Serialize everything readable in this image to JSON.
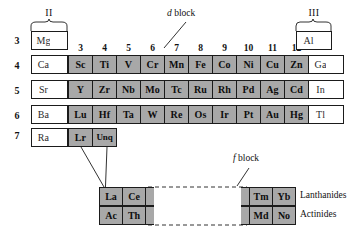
{
  "group_headers": {
    "left": "II",
    "right": "III"
  },
  "column_numbers": [
    "3",
    "4",
    "5",
    "6",
    "7",
    "8",
    "9",
    "10",
    "11",
    "12"
  ],
  "row_numbers": [
    "3",
    "4",
    "5",
    "6",
    "7"
  ],
  "annotations": {
    "d_block": "d block",
    "d_block_italic": "d",
    "d_block_rest": " block",
    "f_block_italic": "f",
    "f_block_rest": " block",
    "lanthanides": "Lanthanides",
    "actinides": "Actinides"
  },
  "main_table": {
    "rows": [
      {
        "period": "3",
        "cells": [
          {
            "symbol": "Mg",
            "type": "plain"
          },
          {
            "symbol": "",
            "type": "empty-d"
          },
          {
            "symbol": "",
            "type": "empty-d"
          },
          {
            "symbol": "",
            "type": "empty-d"
          },
          {
            "symbol": "",
            "type": "empty-d"
          },
          {
            "symbol": "",
            "type": "empty-d"
          },
          {
            "symbol": "",
            "type": "empty-d"
          },
          {
            "symbol": "",
            "type": "empty-d"
          },
          {
            "symbol": "",
            "type": "empty-d"
          },
          {
            "symbol": "",
            "type": "empty-d"
          },
          {
            "symbol": "",
            "type": "empty-d"
          },
          {
            "symbol": "Al",
            "type": "plain"
          }
        ]
      },
      {
        "period": "4",
        "cells": [
          {
            "symbol": "Ca",
            "type": "plain"
          },
          {
            "symbol": "Sc",
            "type": "d"
          },
          {
            "symbol": "Ti",
            "type": "d"
          },
          {
            "symbol": "V",
            "type": "d"
          },
          {
            "symbol": "Cr",
            "type": "d"
          },
          {
            "symbol": "Mn",
            "type": "d"
          },
          {
            "symbol": "Fe",
            "type": "d"
          },
          {
            "symbol": "Co",
            "type": "d"
          },
          {
            "symbol": "Ni",
            "type": "d"
          },
          {
            "symbol": "Cu",
            "type": "d"
          },
          {
            "symbol": "Zn",
            "type": "d"
          },
          {
            "symbol": "Ga",
            "type": "plain"
          }
        ]
      },
      {
        "period": "5",
        "cells": [
          {
            "symbol": "Sr",
            "type": "plain"
          },
          {
            "symbol": "Y",
            "type": "d"
          },
          {
            "symbol": "Zr",
            "type": "d"
          },
          {
            "symbol": "Nb",
            "type": "d"
          },
          {
            "symbol": "Mo",
            "type": "d"
          },
          {
            "symbol": "Tc",
            "type": "d"
          },
          {
            "symbol": "Ru",
            "type": "d"
          },
          {
            "symbol": "Rh",
            "type": "d"
          },
          {
            "symbol": "Pd",
            "type": "d"
          },
          {
            "symbol": "Ag",
            "type": "d"
          },
          {
            "symbol": "Cd",
            "type": "d"
          },
          {
            "symbol": "In",
            "type": "plain"
          }
        ]
      },
      {
        "period": "6",
        "cells": [
          {
            "symbol": "Ba",
            "type": "plain"
          },
          {
            "symbol": "Lu",
            "type": "d"
          },
          {
            "symbol": "Hf",
            "type": "d"
          },
          {
            "symbol": "Ta",
            "type": "d"
          },
          {
            "symbol": "W",
            "type": "d"
          },
          {
            "symbol": "Re",
            "type": "d"
          },
          {
            "symbol": "Os",
            "type": "d"
          },
          {
            "symbol": "Ir",
            "type": "d"
          },
          {
            "symbol": "Pt",
            "type": "d"
          },
          {
            "symbol": "Au",
            "type": "d"
          },
          {
            "symbol": "Hg",
            "type": "d"
          },
          {
            "symbol": "Tl",
            "type": "plain"
          }
        ]
      },
      {
        "period": "7",
        "cells": [
          {
            "symbol": "Ra",
            "type": "plain"
          },
          {
            "symbol": "Lr",
            "type": "d"
          },
          {
            "symbol": "Unq",
            "type": "d"
          }
        ]
      }
    ]
  },
  "f_block": {
    "left_group": {
      "row1": [
        "La",
        "Ce"
      ],
      "row2": [
        "Ac",
        "Th"
      ]
    },
    "right_group": {
      "row1": [
        "Tm",
        "Yb"
      ],
      "row2": [
        "Md",
        "No"
      ]
    },
    "series_labels": [
      "Lanthanides",
      "Actinides"
    ]
  },
  "colors": {
    "d_block_fill": "#a8a8a8",
    "plain_fill": "#ffffff",
    "border": "#1b1b1b",
    "text": "#111111"
  }
}
